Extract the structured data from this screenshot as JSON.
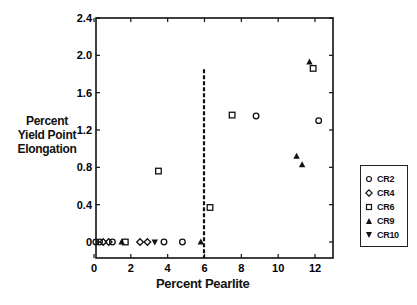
{
  "chart_data": {
    "type": "scatter",
    "title": "",
    "xlabel": "Percent Pearlite",
    "ylabel": "Percent Yield Point Elongation",
    "ylabel_lines": [
      "Percent",
      "Yield Point",
      "Elongation"
    ],
    "xlim": [
      0,
      13
    ],
    "ylim": [
      -0.1,
      2.4
    ],
    "xticks": [
      0,
      2,
      4,
      6,
      8,
      10,
      12
    ],
    "yticks": [
      0,
      0.4,
      0.8,
      1.2,
      1.6,
      2.0,
      2.4
    ],
    "ytick_labels": [
      "0",
      "0.4",
      "0.8",
      "1.2",
      "1.6",
      "2.0",
      "2.4"
    ],
    "xtick_labels": [
      "0",
      "2",
      "4",
      "6",
      "8",
      "10",
      "12"
    ],
    "grid": false,
    "legend_position": "right",
    "reference_line": {
      "type": "vertical-dashed",
      "x": 6.2,
      "y_range": [
        -0.1,
        1.85
      ]
    },
    "series": [
      {
        "name": "CR2",
        "marker": "circle",
        "x": [
          0.1,
          0.3,
          1.0,
          3.8,
          4.8,
          8.8,
          12.2
        ],
        "y": [
          0,
          0,
          0,
          0,
          0,
          1.35,
          1.3
        ]
      },
      {
        "name": "CR4",
        "marker": "diamond",
        "x": [
          0.5,
          0.8,
          2.5,
          2.9
        ],
        "y": [
          0,
          0,
          0,
          0
        ]
      },
      {
        "name": "CR6",
        "marker": "square",
        "x": [
          1.7,
          3.5,
          6.3,
          7.5,
          11.9
        ],
        "y": [
          0,
          0.76,
          0.37,
          1.36,
          1.86
        ]
      },
      {
        "name": "CR9",
        "marker": "triangle-up",
        "x": [
          1.5,
          5.8,
          11.0,
          11.3,
          11.7
        ],
        "y": [
          0,
          0,
          0.92,
          0.83,
          1.93
        ]
      },
      {
        "name": "CR10",
        "marker": "triangle-down",
        "x": [
          3.3
        ],
        "y": [
          0
        ]
      }
    ]
  },
  "legend": {
    "items": [
      {
        "label": "CR2",
        "marker": "circle"
      },
      {
        "label": "CR4",
        "marker": "diamond"
      },
      {
        "label": "CR6",
        "marker": "square"
      },
      {
        "label": "CR9",
        "marker": "triangle-up"
      },
      {
        "label": "CR10",
        "marker": "triangle-down"
      }
    ]
  }
}
